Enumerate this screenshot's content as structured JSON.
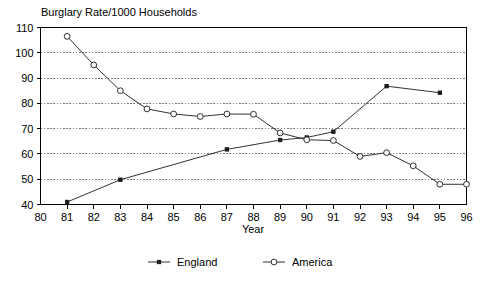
{
  "chart_data": {
    "type": "line",
    "title": "Burglary Rate/1000 Households",
    "xlabel": "Year",
    "ylabel": "",
    "x": [
      80,
      81,
      82,
      83,
      84,
      85,
      86,
      87,
      88,
      89,
      90,
      91,
      92,
      93,
      94,
      95,
      96
    ],
    "xtick_labels": [
      "80",
      "81",
      "82",
      "83",
      "84",
      "85",
      "86",
      "87",
      "88",
      "89",
      "90",
      "91",
      "92",
      "93",
      "94",
      "95",
      "96"
    ],
    "ytick_labels": [
      "40",
      "50",
      "60",
      "70",
      "80",
      "90",
      "100",
      "110"
    ],
    "yticks": [
      40,
      50,
      60,
      70,
      80,
      90,
      100,
      110
    ],
    "xlim": [
      80,
      96
    ],
    "ylim": [
      40,
      110
    ],
    "grid": true,
    "legend_position": "bottom",
    "series": [
      {
        "name": "England",
        "marker": "filled-square",
        "color": "#1a1a1a",
        "x": [
          81,
          83,
          87,
          89,
          90,
          91,
          93,
          95
        ],
        "values": [
          41,
          49.8,
          61.8,
          65.5,
          66.5,
          68.8,
          86.8,
          84.2
        ]
      },
      {
        "name": "America",
        "marker": "open-circle",
        "color": "#1a1a1a",
        "x": [
          81,
          82,
          83,
          84,
          85,
          86,
          87,
          88,
          89,
          90,
          91,
          92,
          93,
          94,
          95,
          96
        ],
        "values": [
          106.5,
          95.2,
          85,
          77.8,
          75.8,
          74.8,
          75.8,
          75.7,
          68.3,
          65.6,
          65.3,
          59,
          60.5,
          55.3,
          48,
          48
        ]
      }
    ],
    "caption": ""
  }
}
